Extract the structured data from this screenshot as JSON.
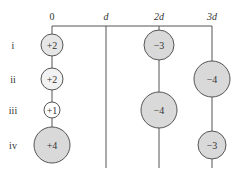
{
  "axis": {
    "labels": [
      "0",
      "d",
      "2d",
      "3d"
    ],
    "x": [
      52,
      106,
      159,
      212
    ]
  },
  "rows": [
    {
      "label": "i",
      "y": 45
    },
    {
      "label": "ii",
      "y": 79
    },
    {
      "label": "iii",
      "y": 110
    },
    {
      "label": "iv",
      "y": 145
    }
  ],
  "charges": [
    {
      "row": 0,
      "pos": 0,
      "label": "+2",
      "r": 11,
      "fill": "#e6e6e6"
    },
    {
      "row": 1,
      "pos": 0,
      "label": "+2",
      "r": 11,
      "fill": "#f2f2f2"
    },
    {
      "row": 2,
      "pos": 0,
      "label": "+1",
      "r": 8,
      "fill": "#ffffff"
    },
    {
      "row": 3,
      "pos": 0,
      "label": "+4",
      "r": 18,
      "fill": "#d9d9d9"
    },
    {
      "row": 0,
      "pos": 2,
      "label": "−3",
      "r": 15,
      "fill": "#d9d9d9"
    },
    {
      "row": 2,
      "pos": 2,
      "label": "−4",
      "r": 18,
      "fill": "#d9d9d9"
    },
    {
      "row": 1,
      "pos": 3,
      "label": "−4",
      "r": 18,
      "fill": "#d9d9d9"
    },
    {
      "row": 3,
      "pos": 3,
      "label": "−3",
      "r": 14,
      "fill": "#d9d9d9"
    }
  ],
  "colors": {
    "line": "#555555",
    "stroke": "#555555"
  }
}
